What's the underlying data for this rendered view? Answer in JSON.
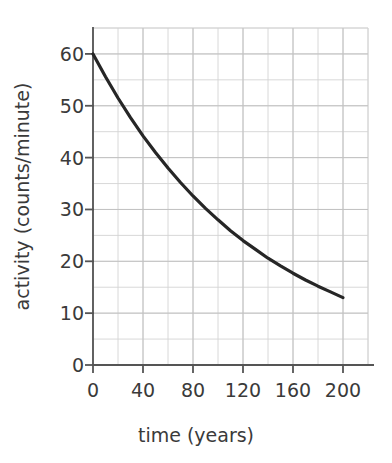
{
  "chart_data": {
    "type": "line",
    "title": "",
    "subtitle": "",
    "xlabel": "time (years)",
    "ylabel": "activity (counts/minute)",
    "xlim": [
      0,
      220
    ],
    "ylim": [
      0,
      65
    ],
    "xticks": [
      0,
      40,
      80,
      120,
      160,
      200
    ],
    "xtick_labels": [
      "0",
      "40",
      "80",
      "120",
      "160",
      "200"
    ],
    "yticks": [
      0,
      10,
      20,
      30,
      40,
      50,
      60
    ],
    "ytick_labels": [
      "0",
      "10",
      "20",
      "30",
      "40",
      "50",
      "60"
    ],
    "x_minor_step": 20,
    "y_minor_step": 5,
    "grid": true,
    "grid_color": "#c9c9c9",
    "legend": null,
    "legend_position": "none",
    "line_color": "#262626",
    "line_width": 3.2,
    "axis_color": "#555555",
    "series": [
      {
        "name": "activity",
        "x": [
          0,
          10,
          20,
          30,
          40,
          50,
          60,
          70,
          80,
          90,
          100,
          110,
          120,
          130,
          140,
          150,
          160,
          170,
          180,
          190,
          200
        ],
        "y": [
          60.0,
          55.6,
          51.5,
          47.7,
          44.2,
          41.0,
          38.0,
          35.2,
          32.6,
          30.2,
          28.0,
          25.9,
          24.0,
          22.3,
          20.6,
          19.1,
          17.7,
          16.4,
          15.2,
          14.1,
          13.0
        ]
      }
    ],
    "annotations": []
  },
  "axes": {
    "y_title": "activity (counts/minute)",
    "x_title": "time (years)"
  }
}
